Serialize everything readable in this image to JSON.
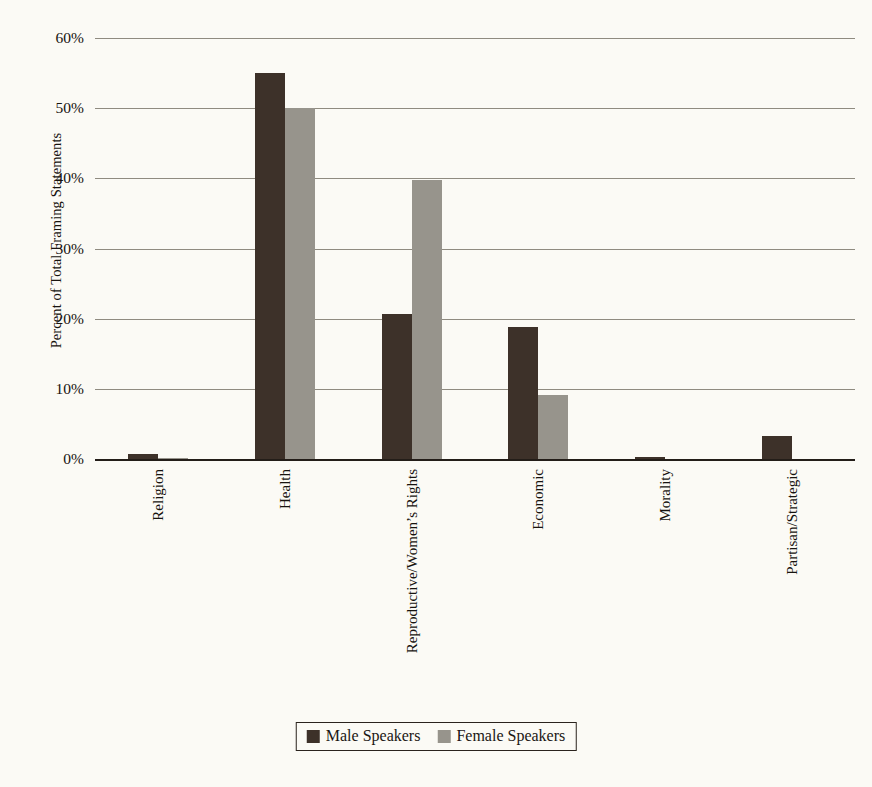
{
  "chart_data": {
    "type": "bar",
    "title": "",
    "xlabel": "",
    "ylabel": "Percent of Total Framing Statements",
    "ylim": [
      0,
      60
    ],
    "ytick_labels": [
      "60%",
      "50%",
      "40%",
      "30%",
      "20%",
      "10%",
      "0%"
    ],
    "ytick_values": [
      60,
      50,
      40,
      30,
      20,
      10,
      0
    ],
    "grid": true,
    "legend_position": "bottom",
    "categories": [
      "Religion",
      "Health",
      "Reproductive/Women’s Rights",
      "Economic",
      "Morality",
      "Partisan/Strategic"
    ],
    "series": [
      {
        "name": "Male Speakers",
        "color": "#3d3129",
        "values": [
          0.7,
          55.0,
          20.7,
          18.8,
          0.3,
          3.3
        ]
      },
      {
        "name": "Female Speakers",
        "color": "#97948c",
        "values": [
          0.2,
          50.0,
          39.8,
          9.1,
          0.0,
          0.0
        ]
      }
    ]
  },
  "legend": {
    "items": [
      {
        "label": "Male Speakers"
      },
      {
        "label": "Female Speakers"
      }
    ]
  }
}
